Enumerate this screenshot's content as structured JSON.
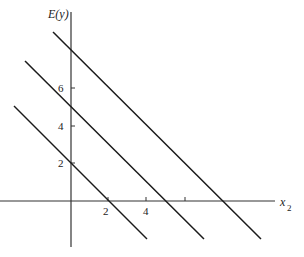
{
  "diagram": {
    "y_axis_label": "E(y)",
    "x_axis_label": "x",
    "x_axis_subscript": "2",
    "y_ticks": [
      {
        "label": "2",
        "value": 2
      },
      {
        "label": "4",
        "value": 4
      },
      {
        "label": "6",
        "value": 6
      }
    ],
    "x_ticks": [
      {
        "label": "2",
        "value": 2
      },
      {
        "label": "4",
        "value": 4
      },
      {
        "label": "",
        "value": 6
      }
    ],
    "lines": [
      {
        "name": "line-1",
        "y_intercept": 2,
        "x_intercept": 2
      },
      {
        "name": "line-2",
        "y_intercept": 5,
        "x_intercept": 5
      },
      {
        "name": "line-3",
        "y_intercept": 8,
        "x_intercept": 8
      }
    ],
    "line_color": "#1a1a1a"
  }
}
